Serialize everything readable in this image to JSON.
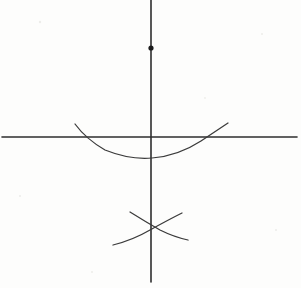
{
  "figure": {
    "background_color": "#fdfdfc",
    "ink_color": "#2e2e2e",
    "curve_color": "#3a3a3a",
    "point_color": "#1c1c1c"
  },
  "chart_data": {
    "type": "line",
    "xlabel": "",
    "ylabel": "",
    "grid": false,
    "legend": false,
    "xlim": [
      0,
      301
    ],
    "ylim": [
      288,
      0
    ],
    "origin": {
      "x": 151,
      "y": 137
    },
    "series": [
      {
        "name": "vertical-axis",
        "kind": "line",
        "x": [
          151,
          151
        ],
        "y": [
          0,
          282
        ]
      },
      {
        "name": "horizontal-axis",
        "kind": "line",
        "x": [
          2,
          297
        ],
        "y": [
          137,
          137
        ]
      },
      {
        "name": "parabola",
        "kind": "curve",
        "path": "M 75 124 Q 86 139 105 150 Q 130 160 152 158 Q 178 156 201 141 Q 216 131 228 123",
        "vertex": {
          "x": 152,
          "y": 157
        },
        "x_intercepts": [
          88,
          213
        ],
        "endpoints": [
          {
            "x": 75,
            "y": 124
          },
          {
            "x": 228,
            "y": 123
          }
        ]
      },
      {
        "name": "arc-upper-left-to-lower-right",
        "kind": "curve",
        "path": "M 130 212 Q 146 222 160 230 Q 174 237 188 240",
        "endpoints": [
          {
            "x": 130,
            "y": 212
          },
          {
            "x": 188,
            "y": 240
          }
        ]
      },
      {
        "name": "arc-lower-left-to-upper-right",
        "kind": "curve",
        "path": "M 113 245 Q 133 240 150 230 Q 168 220 182 213",
        "endpoints": [
          {
            "x": 113,
            "y": 245
          },
          {
            "x": 182,
            "y": 213
          }
        ]
      }
    ],
    "points": [
      {
        "name": "marked-point-on-y-axis",
        "x": 151,
        "y": 48,
        "radius": 2.6,
        "label": ""
      }
    ],
    "intersections": [
      {
        "name": "origin",
        "x": 151,
        "y": 137
      },
      {
        "name": "arc-crossing",
        "x": 152,
        "y": 228
      },
      {
        "name": "parabola-left-root",
        "x": 88,
        "y": 137
      },
      {
        "name": "parabola-right-root",
        "x": 213,
        "y": 137
      }
    ],
    "specks": [
      {
        "x": 40,
        "y": 22,
        "r": 1.2
      },
      {
        "x": 262,
        "y": 34,
        "r": 1.0
      },
      {
        "x": 20,
        "y": 196,
        "r": 1.1
      },
      {
        "x": 205,
        "y": 98,
        "r": 0.9
      },
      {
        "x": 92,
        "y": 272,
        "r": 1.0
      },
      {
        "x": 276,
        "y": 230,
        "r": 1.1
      }
    ]
  }
}
